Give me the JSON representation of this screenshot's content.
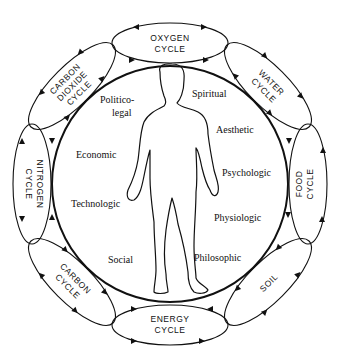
{
  "diagram": {
    "center_figure": "human-silhouette",
    "cycles": [
      {
        "id": "oxygen",
        "lines": [
          "OXYGEN",
          "CYCLE"
        ],
        "angle": 0
      },
      {
        "id": "water",
        "lines": [
          "WATER",
          "CYCLE"
        ],
        "angle": 45
      },
      {
        "id": "food",
        "lines": [
          "FOOD",
          "CYCLE"
        ],
        "angle": 90
      },
      {
        "id": "soil",
        "lines": [
          "SOIL"
        ],
        "angle": 135
      },
      {
        "id": "energy",
        "lines": [
          "ENERGY",
          "CYCLE"
        ],
        "angle": 180
      },
      {
        "id": "carbon",
        "lines": [
          "CARBON",
          "CYCLE"
        ],
        "angle": 225
      },
      {
        "id": "nitrogen",
        "lines": [
          "NITROGEN",
          "CYCLE"
        ],
        "angle": 270
      },
      {
        "id": "carbon-dioxide",
        "lines": [
          "CARBON",
          "DIOXIDE",
          "CYCLE"
        ],
        "angle": 315
      }
    ],
    "aspects_left": [
      {
        "lines": [
          "Politico-",
          "legal"
        ]
      },
      {
        "lines": [
          "Economic"
        ]
      },
      {
        "lines": [
          "Technologic"
        ]
      },
      {
        "lines": [
          "Social"
        ]
      }
    ],
    "aspects_right": [
      {
        "lines": [
          "Spiritual"
        ]
      },
      {
        "lines": [
          "Aesthetic"
        ]
      },
      {
        "lines": [
          "Psychologic"
        ]
      },
      {
        "lines": [
          "Physiologic"
        ]
      },
      {
        "lines": [
          "Philosophic"
        ]
      }
    ],
    "colors": {
      "stroke": "#111111",
      "background": "#ffffff"
    }
  }
}
